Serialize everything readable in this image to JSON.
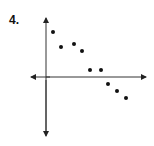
{
  "problem_number": "4.",
  "chart_data": {
    "type": "scatter",
    "title": "",
    "xlabel": "",
    "ylabel": "",
    "grid": false,
    "legend": null,
    "axes": "cartesian with arrows, no tick labels",
    "points": [
      {
        "x": 1,
        "y": 6
      },
      {
        "x": 2,
        "y": 4
      },
      {
        "x": 3.5,
        "y": 4.5
      },
      {
        "x": 4.5,
        "y": 3.5
      },
      {
        "x": 5.5,
        "y": 1
      },
      {
        "x": 7,
        "y": 1
      },
      {
        "x": 8,
        "y": -1
      },
      {
        "x": 9,
        "y": -2
      },
      {
        "x": 10,
        "y": -3
      }
    ],
    "pixel_points": [
      [
        53,
        32
      ],
      [
        61,
        47
      ],
      [
        74,
        44
      ],
      [
        82,
        51
      ],
      [
        90,
        70
      ],
      [
        101,
        70
      ],
      [
        108,
        84
      ],
      [
        117,
        91
      ],
      [
        126,
        98
      ]
    ],
    "axis_origin_px": [
      46,
      77
    ],
    "trend": "negative correlation"
  }
}
